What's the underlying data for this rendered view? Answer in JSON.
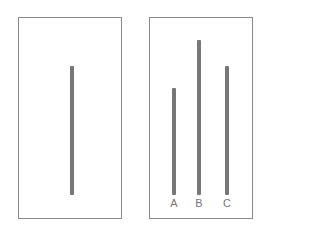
{
  "diagram": {
    "title": "",
    "line_color": "#777777",
    "border_color": "#8a8a8a",
    "reference_card": {
      "line": {
        "x": 70,
        "top": 66,
        "bottom": 195
      }
    },
    "comparison_card": {
      "lines": [
        {
          "label": "A",
          "x": 172,
          "top": 88,
          "bottom": 195
        },
        {
          "label": "B",
          "x": 197,
          "top": 40,
          "bottom": 195
        },
        {
          "label": "C",
          "x": 225,
          "top": 66,
          "bottom": 195
        }
      ]
    }
  }
}
